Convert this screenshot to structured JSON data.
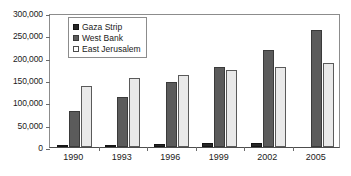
{
  "chart_data": {
    "type": "bar",
    "title": "",
    "subtitle": "",
    "xlabel": "",
    "ylabel": "",
    "categories": [
      "1990",
      "1993",
      "1996",
      "1999",
      "2002",
      "2005"
    ],
    "series": [
      {
        "name": "Gaza Strip",
        "color": "#262626",
        "values": [
          3000,
          5000,
          7000,
          8000,
          10000,
          0
        ]
      },
      {
        "name": "West Bank",
        "color": "#5b5b5b",
        "values": [
          80000,
          113000,
          145000,
          180000,
          218000,
          263000
        ]
      },
      {
        "name": "East Jerusalem",
        "color": "#e9e9e9",
        "values": [
          136000,
          154000,
          162000,
          173000,
          179000,
          188000
        ]
      }
    ],
    "ylim": [
      0,
      300000
    ],
    "yticks": [
      0,
      50000,
      100000,
      150000,
      200000,
      250000,
      300000
    ],
    "ytick_labels": [
      "0",
      "50,000",
      "100,000",
      "150,000",
      "200,000",
      "250,000",
      "300,000"
    ],
    "grid": false,
    "legend_position": "top-left",
    "legend_entries": [
      "Gaza Strip",
      "West Bank",
      "East Jerusalem"
    ]
  }
}
